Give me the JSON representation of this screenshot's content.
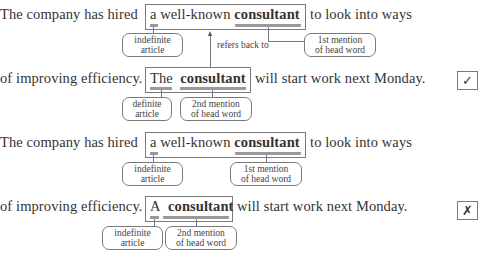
{
  "examples": [
    {
      "line1": {
        "before": "The company has hired",
        "box_plain": "a well-known",
        "box_bold": "consultant",
        "after": "to look into ways"
      },
      "line1_callouts": [
        "indefinite article",
        "1st mention of head word"
      ],
      "line1_callout_parts": {
        "left": [
          "indefinite",
          "article"
        ],
        "right": [
          "1st mention",
          "of head word"
        ]
      },
      "arrow_label": "refers back to",
      "line2": {
        "before": "of improving efficiency.",
        "box_plain": "The",
        "box_bold": "consultant",
        "after": "will start work next Monday."
      },
      "line2_callout_parts": {
        "left": [
          "definite",
          "article"
        ],
        "right": [
          "2nd mention",
          "of head word"
        ]
      },
      "verdict": "✓",
      "verdict_name": "correct"
    },
    {
      "line1": {
        "before": "The company has hired",
        "box_plain": "a well-known",
        "box_bold": "consultant",
        "after": "to look into ways"
      },
      "line1_callout_parts": {
        "left": [
          "indefinite",
          "article"
        ],
        "right": [
          "1st mention",
          "of head word"
        ]
      },
      "line2": {
        "before": "of improving efficiency.",
        "box_plain": "A",
        "box_bold": "consultant",
        "after": "will start work next Monday."
      },
      "line2_callout_parts": {
        "left": [
          "indefinite",
          "article"
        ],
        "right": [
          "2nd mention",
          "of head word"
        ]
      },
      "verdict": "✗",
      "verdict_name": "incorrect"
    }
  ]
}
